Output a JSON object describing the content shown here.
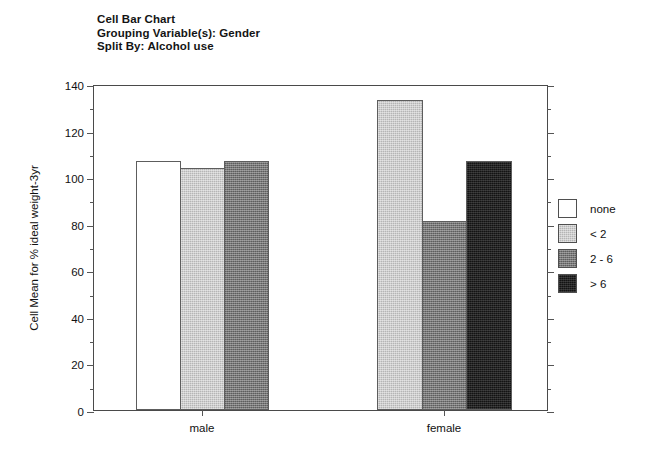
{
  "title_lines": [
    "Cell Bar Chart",
    "Grouping Variable(s): Gender",
    "Split By: Alcohol use"
  ],
  "axis": {
    "y_title": "Cell Mean for % ideal weight-3yr",
    "y_ticks": [
      "0",
      "20",
      "40",
      "60",
      "80",
      "100",
      "120",
      "140"
    ],
    "x_labels": [
      "male",
      "female"
    ]
  },
  "legend": {
    "entries": [
      {
        "label": "none",
        "color": "#ffffff"
      },
      {
        "label": "< 2",
        "color": "#b5b5b5"
      },
      {
        "label": "2 - 6",
        "color": "#777777"
      },
      {
        "label": "> 6",
        "color": "#131313"
      }
    ]
  },
  "chart_data": {
    "type": "bar",
    "title": "Cell Bar Chart",
    "subtitle": "Grouping Variable(s): Gender / Split By: Alcohol use",
    "xlabel": "",
    "ylabel": "Cell Mean for % ideal weight-3yr",
    "categories": [
      "male",
      "female"
    ],
    "ylim": [
      0,
      140
    ],
    "ytick_step": 20,
    "yminor_step": 10,
    "grid": false,
    "legend_position": "right",
    "series": [
      {
        "name": "none",
        "color": "#ffffff",
        "values": [
          107,
          null
        ]
      },
      {
        "name": "< 2",
        "color": "#b5b5b5",
        "values": [
          104,
          133
        ]
      },
      {
        "name": "2 - 6",
        "color": "#777777",
        "values": [
          107,
          81
        ]
      },
      {
        "name": "> 6",
        "color": "#131313",
        "values": [
          null,
          107
        ]
      }
    ]
  }
}
